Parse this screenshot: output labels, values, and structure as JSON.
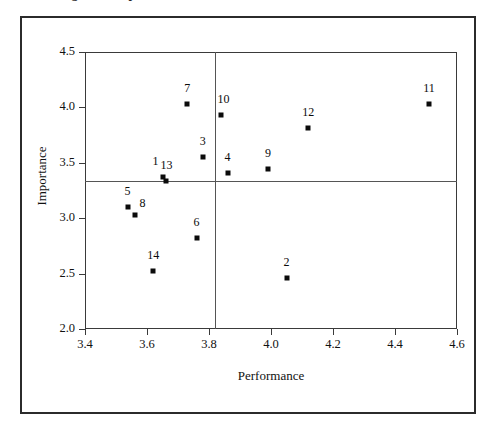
{
  "figure": {
    "caption_sliver": "Figure 3. Importance-Performance Matrix of Service Attributes"
  },
  "chart_data": {
    "type": "scatter",
    "title": "",
    "xlabel": "Performance",
    "ylabel": "Importance",
    "xlim": [
      3.4,
      4.6
    ],
    "ylim": [
      2.0,
      4.5
    ],
    "xticks": [
      "3.4",
      "3.6",
      "3.8",
      "4.0",
      "4.2",
      "4.4",
      "4.6"
    ],
    "xtick_values": [
      3.4,
      3.6,
      3.8,
      4.0,
      4.2,
      4.4,
      4.6
    ],
    "yticks": [
      "2.0",
      "2.5",
      "3.0",
      "3.5",
      "4.0",
      "4.5"
    ],
    "ytick_values": [
      2.0,
      2.5,
      3.0,
      3.5,
      4.0,
      4.5
    ],
    "grid": false,
    "legend": null,
    "reference_lines": {
      "vertical_x": 3.82,
      "horizontal_y": 3.34
    },
    "marker": "filled-square",
    "marker_color": "#0b0b0b",
    "points": [
      {
        "label": "1",
        "x": 3.65,
        "y": 3.37,
        "label_dx": -7,
        "label_dy": -9
      },
      {
        "label": "2",
        "x": 4.05,
        "y": 2.46,
        "label_dx": 0,
        "label_dy": -9
      },
      {
        "label": "3",
        "x": 3.78,
        "y": 3.55,
        "label_dx": 0,
        "label_dy": -9
      },
      {
        "label": "4",
        "x": 3.86,
        "y": 3.41,
        "label_dx": 0,
        "label_dy": -9
      },
      {
        "label": "5",
        "x": 3.54,
        "y": 3.1,
        "label_dx": -1,
        "label_dy": -9
      },
      {
        "label": "6",
        "x": 3.76,
        "y": 2.82,
        "label_dx": 0,
        "label_dy": -9
      },
      {
        "label": "7",
        "x": 3.73,
        "y": 4.03,
        "label_dx": 0,
        "label_dy": -9
      },
      {
        "label": "8",
        "x": 3.56,
        "y": 3.03,
        "label_dx": 8,
        "label_dy": -5
      },
      {
        "label": "9",
        "x": 3.99,
        "y": 3.44,
        "label_dx": 0,
        "label_dy": -9
      },
      {
        "label": "10",
        "x": 3.84,
        "y": 3.93,
        "label_dx": 2,
        "label_dy": -9
      },
      {
        "label": "11",
        "x": 4.51,
        "y": 4.03,
        "label_dx": 0,
        "label_dy": -9
      },
      {
        "label": "12",
        "x": 4.12,
        "y": 3.81,
        "label_dx": 0,
        "label_dy": -9
      },
      {
        "label": "13",
        "x": 3.66,
        "y": 3.34,
        "label_dx": 1,
        "label_dy": -9
      },
      {
        "label": "14",
        "x": 3.62,
        "y": 2.52,
        "label_dx": 0,
        "label_dy": -9
      }
    ]
  }
}
